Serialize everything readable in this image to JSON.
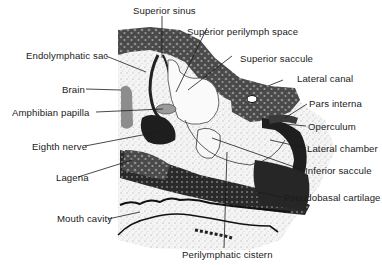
{
  "diagram": {
    "type": "anatomical cross-section",
    "colors": {
      "background": "#ffffff",
      "ink": "#1a1a1a",
      "dark_tissue": "#2b2b2b",
      "mid_tissue": "#6a6a6a",
      "light_tissue": "#bdbdbd",
      "stipple": "#d9d9d9"
    },
    "labels": {
      "superior_sinus": "Superior sinus",
      "superior_perilymph_space": "Superior perilymph space",
      "superior_saccule": "Superior saccule",
      "endolymphatic_sac": "Endolymphatic sac",
      "lateral_canal": "Lateral canal",
      "brain": "Brain",
      "pars_interna": "Pars interna",
      "amphibian_papilla": "Amphibian papilla",
      "operculum": "Operculum",
      "lateral_chamber": "Lateral chamber",
      "eighth_nerve": "Eighth nerve",
      "inferior_saccule": "Inferior saccule",
      "lagena": "Lagena",
      "pseudobasal_cartilage": "Pseudobasal cartilage",
      "mouth_cavity": "Mouth cavity",
      "perilymphatic_cistern": "Perilymphatic cistern"
    }
  }
}
